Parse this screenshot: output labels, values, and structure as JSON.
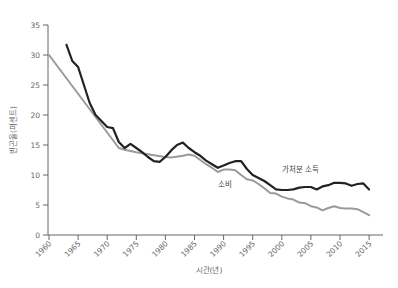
{
  "chart_data": {
    "type": "line",
    "title": "",
    "xlabel": "시간(년)",
    "ylabel": "빈곤율(퍼센트)",
    "xlim": [
      1960,
      2017
    ],
    "ylim": [
      0,
      35
    ],
    "x_ticks": [
      1960,
      1965,
      1970,
      1975,
      1980,
      1985,
      1990,
      1995,
      2000,
      2005,
      2010,
      2015
    ],
    "y_ticks": [
      0,
      5,
      10,
      15,
      20,
      25,
      30,
      35
    ],
    "grid": false,
    "legend": "inline labels",
    "series": [
      {
        "name": "가처분 소득",
        "color": "#222222",
        "label_pos": {
          "x": 2000,
          "y": 10.5
        },
        "x": [
          1963,
          1964,
          1965,
          1966,
          1967,
          1968,
          1969,
          1970,
          1971,
          1972,
          1973,
          1974,
          1975,
          1976,
          1977,
          1978,
          1979,
          1980,
          1981,
          1982,
          1983,
          1984,
          1985,
          1986,
          1987,
          1988,
          1989,
          1990,
          1991,
          1992,
          1993,
          1994,
          1995,
          1996,
          1997,
          1998,
          1999,
          2000,
          2001,
          2002,
          2003,
          2004,
          2005,
          2006,
          2007,
          2008,
          2009,
          2010,
          2011,
          2012,
          2013,
          2014,
          2015
        ],
        "values": [
          31.7,
          29.0,
          28.0,
          25.0,
          22.0,
          20.0,
          19.0,
          18.0,
          17.8,
          15.5,
          14.5,
          15.2,
          14.5,
          13.8,
          13.0,
          12.3,
          12.2,
          13.0,
          14.1,
          15.0,
          15.4,
          14.5,
          13.8,
          13.2,
          12.4,
          11.8,
          11.2,
          11.6,
          12.0,
          12.3,
          12.3,
          11.0,
          10.0,
          9.5,
          9.0,
          8.3,
          7.6,
          7.5,
          7.5,
          7.6,
          7.9,
          8.0,
          8.0,
          7.6,
          8.1,
          8.3,
          8.7,
          8.7,
          8.6,
          8.2,
          8.5,
          8.6,
          7.6
        ]
      },
      {
        "name": "소비",
        "color": "#9a9a9a",
        "label_pos": {
          "x": 1989,
          "y": 8.0
        },
        "x": [
          1960,
          1972,
          1973,
          1975,
          1978,
          1980,
          1981,
          1983,
          1984,
          1985,
          1986,
          1987,
          1988,
          1989,
          1990,
          1991,
          1992,
          1993,
          1994,
          1995,
          1996,
          1997,
          1998,
          1999,
          2000,
          2001,
          2002,
          2003,
          2004,
          2005,
          2006,
          2007,
          2008,
          2009,
          2010,
          2011,
          2012,
          2013,
          2014,
          2015
        ],
        "values": [
          30.0,
          14.5,
          14.2,
          13.8,
          13.3,
          13.0,
          12.9,
          13.2,
          13.4,
          13.2,
          12.5,
          11.8,
          11.2,
          10.5,
          10.9,
          10.9,
          10.8,
          10.0,
          9.3,
          9.1,
          8.5,
          7.8,
          7.0,
          6.9,
          6.4,
          6.1,
          5.9,
          5.4,
          5.3,
          4.8,
          4.6,
          4.1,
          4.5,
          4.8,
          4.5,
          4.4,
          4.4,
          4.3,
          3.8,
          3.3
        ]
      }
    ]
  }
}
